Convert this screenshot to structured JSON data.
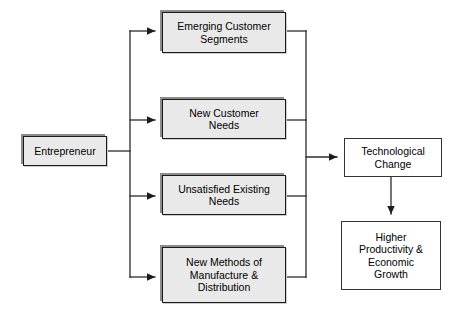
{
  "diagram": {
    "type": "flow-diagram",
    "canvas": {
      "width": 464,
      "height": 317
    },
    "colors": {
      "background": "#ffffff",
      "input_node_fill": "#e9e9e9",
      "input_node_border": "#1a1a1a",
      "input_node_shadow": "#8c8c8c",
      "outcome_node_fill": "#ffffff",
      "outcome_node_border": "#333333",
      "connector": "#2b2b2b"
    },
    "source_node": {
      "id": "entrepreneur",
      "label": "Entrepreneur",
      "style": "filled",
      "x": 23,
      "y": 136,
      "width": 84,
      "height": 30,
      "font_size": 10.5
    },
    "middle_nodes": [
      {
        "id": "emerging-customer-segments",
        "label": "Emerging Customer\nSegments",
        "style": "filled",
        "x": 162,
        "y": 12,
        "width": 124,
        "height": 41,
        "font_size": 10.5
      },
      {
        "id": "new-customer-needs",
        "label": "New Customer\nNeeds",
        "style": "filled",
        "x": 162,
        "y": 99,
        "width": 124,
        "height": 40,
        "font_size": 10.5
      },
      {
        "id": "unsatisfied-existing-needs",
        "label": "Unsatisfied Existing\nNeeds",
        "style": "filled",
        "x": 162,
        "y": 175,
        "width": 124,
        "height": 40,
        "font_size": 10.5
      },
      {
        "id": "new-methods-of-manufacture-and-distribution",
        "label": "New Methods of\nManufacture &\nDistribution",
        "style": "filled",
        "x": 162,
        "y": 247,
        "width": 124,
        "height": 56,
        "font_size": 10.5
      }
    ],
    "outcome_nodes": [
      {
        "id": "technological-change",
        "label": "Technological\nChange",
        "style": "plain",
        "x": 344,
        "y": 138,
        "width": 98,
        "height": 39,
        "font_size": 10.5
      },
      {
        "id": "higher-productivity-economic-growth",
        "label": "Higher\nProductivity &\nEconomic\nGrowth",
        "style": "plain",
        "x": 341,
        "y": 221,
        "width": 100,
        "height": 69,
        "font_size": 10.5
      }
    ],
    "connectors": {
      "left_trunk_x": 130,
      "right_trunk_x": 306,
      "trunk_top_y": 31,
      "trunk_bottom_y": 277,
      "entrepreneur_exit_y": 151,
      "technological_change_entry_y": 157,
      "branch_rows": [
        31,
        120,
        196,
        277
      ],
      "vertical_link": {
        "x": 391,
        "from_y": 177,
        "to_y": 220
      }
    }
  }
}
